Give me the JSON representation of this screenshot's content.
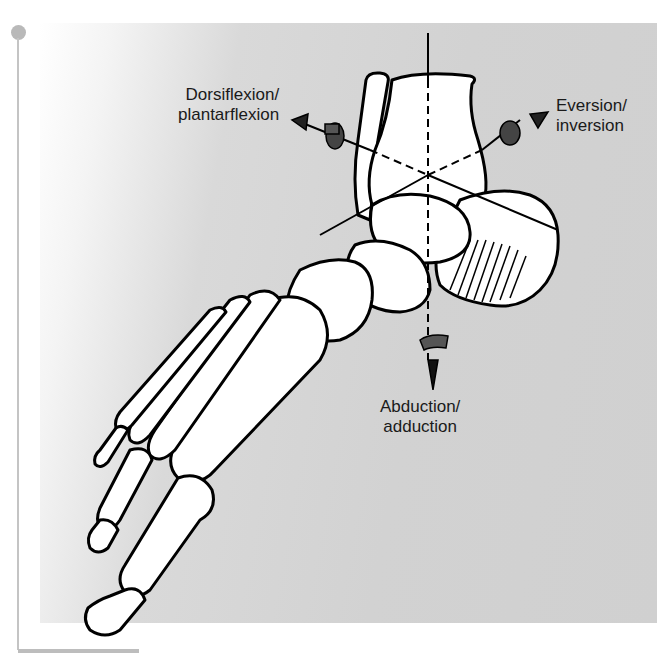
{
  "figure": {
    "type": "anatomical-diagram",
    "background_color": "#d2d2d2",
    "line_color": "#000000",
    "arrow_color": "#444444"
  },
  "labels": {
    "dorsiflexion": {
      "line1": "Dorsiflexion/",
      "line2": "plantarflexion"
    },
    "eversion": {
      "line1": "Eversion/",
      "line2": "inversion"
    },
    "abduction": {
      "line1": "Abduction/",
      "line2": "adduction"
    }
  },
  "page_decoration": {
    "rule_color": "#c4c4c4",
    "dot_color": "#b9b9b9"
  }
}
